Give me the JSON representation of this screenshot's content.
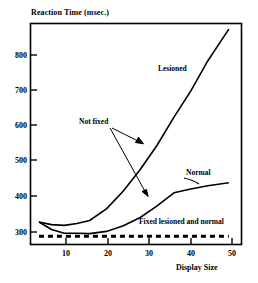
{
  "chart_data": {
    "type": "line",
    "title": "",
    "ylabel": "Reaction Time (msec.)",
    "xlabel": "Display Size",
    "xlim": [
      2,
      52
    ],
    "ylim": [
      280,
      870
    ],
    "grid": false,
    "legend_position": "inline-annotations",
    "xticks": [
      10,
      20,
      30,
      40,
      50
    ],
    "yticks": [
      300,
      400,
      500,
      600,
      700,
      800
    ],
    "series": [
      {
        "name": "Lesioned",
        "style": "solid",
        "x": [
          4,
          7,
          10,
          13,
          16,
          20,
          24,
          28,
          32,
          36,
          40,
          44,
          49
        ],
        "values": [
          340,
          333,
          331,
          336,
          344,
          375,
          423,
          480,
          545,
          620,
          690,
          770,
          855
        ]
      },
      {
        "name": "Normal",
        "style": "solid",
        "x": [
          4,
          7,
          10,
          13,
          16,
          20,
          24,
          28,
          32,
          36,
          40,
          44,
          49
        ],
        "values": [
          340,
          320,
          310,
          310,
          309,
          315,
          330,
          352,
          383,
          418,
          428,
          437,
          445
        ]
      },
      {
        "name": "Fixed lesioned and normal",
        "style": "dashed",
        "x": [
          4,
          10,
          20,
          30,
          40,
          49
        ],
        "values": [
          302,
          302,
          302,
          302,
          302,
          302
        ]
      }
    ],
    "annotations": [
      {
        "text": "Lesioned",
        "x": 28.5,
        "y": 745,
        "target": null
      },
      {
        "text": "Normal",
        "x": 40.5,
        "y": 470,
        "target": null
      },
      {
        "text": "Not fixed",
        "x": 14.5,
        "y": 600,
        "targets": [
          [
            28.5,
            548
          ],
          [
            30.5,
            403
          ]
        ]
      },
      {
        "text": "Fixed lesioned and normal",
        "x": 28,
        "y": 338,
        "target": null
      }
    ]
  },
  "axes": {
    "y_title": "Reaction Time (msec.)",
    "x_title": "Display Size",
    "y_tick_labels": [
      "800",
      "700",
      "600",
      "500",
      "400",
      "300"
    ],
    "x_tick_labels": [
      "10",
      "20",
      "30",
      "40",
      "50"
    ]
  },
  "annotations": {
    "lesioned": "Lesioned",
    "normal": "Normal",
    "not_fixed": "Not fixed",
    "fixed_both": "Fixed lesioned and normal"
  },
  "colors": {
    "line": "#000000",
    "frame": "#000000",
    "background": "#ffffff"
  }
}
